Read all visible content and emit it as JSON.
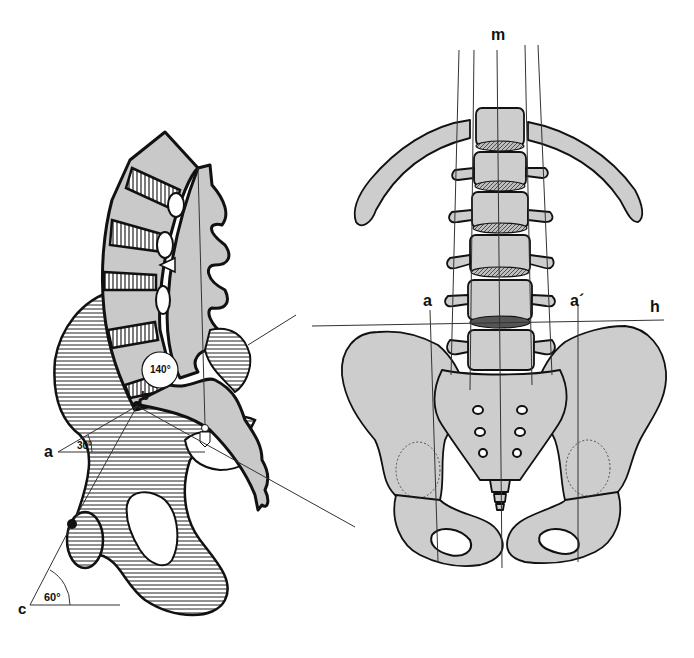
{
  "figure": {
    "left_view": {
      "description": "Lateral view of lumbar spine, sacrum and pelvis",
      "labels": {
        "point_a": "a",
        "point_b": "b",
        "point_c": "c"
      },
      "angles": {
        "sacral_angle": "30°",
        "lumbosacral_angle": "140°",
        "pelvic_angle": "60°"
      }
    },
    "right_view": {
      "description": "Anterior view of lumbar spine and pelvis",
      "labels": {
        "midline": "m",
        "left_line": "a",
        "right_line": "a´",
        "horizontal_line": "h"
      }
    },
    "colors": {
      "bone_fill": "#c9c9c9",
      "outline": "#111111",
      "background": "#ffffff"
    }
  }
}
